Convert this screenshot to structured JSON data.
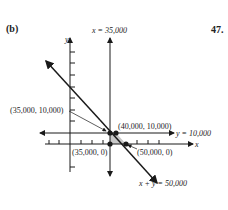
{
  "part_label": "(b)",
  "problem_number": "47.",
  "axes": {
    "x_label": "x",
    "y_label": "y"
  },
  "lines": {
    "vertical": "x = 35,000",
    "horizontal": "y = 10,000",
    "diagonal": "x + y = 50,000"
  },
  "points": [
    {
      "label": "(35,000, 10,000)"
    },
    {
      "label": "(40,000, 10,000)"
    },
    {
      "label": "(35,000, 0)"
    },
    {
      "label": "(50,000, 0)"
    }
  ],
  "colors": {
    "ink": "#1a1a1a",
    "shade": "#c8c8c8"
  }
}
